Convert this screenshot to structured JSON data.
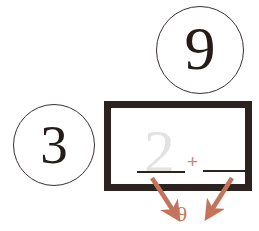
{
  "diagram": {
    "colors": {
      "ink": "#231c18",
      "frame": "#2c2320",
      "ghost": "#e2e2e2",
      "accent": "#c4745a",
      "plus": "#c98a74",
      "background": "#ffffff"
    },
    "bubbles": [
      {
        "id": "nine",
        "value": "9"
      },
      {
        "id": "three",
        "value": "3"
      }
    ],
    "equation": {
      "ghost_digit": "2",
      "operator": "+",
      "blank_left": "",
      "blank_right": ""
    },
    "result": {
      "value": "9",
      "arrow_left_name": "arrow-to-result-left",
      "arrow_right_name": "arrow-to-result-right"
    },
    "icons": {
      "arrow_left": "arrow-down-right-icon",
      "arrow_right": "arrow-down-left-icon"
    }
  }
}
